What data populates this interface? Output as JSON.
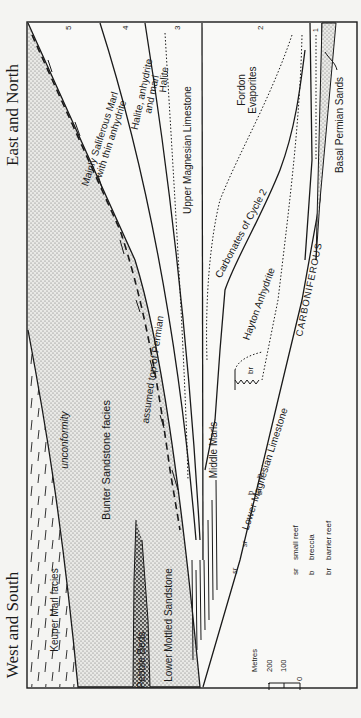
{
  "figure": {
    "orientation": "rotated 90deg counter-clockwise",
    "directions": {
      "top": "East and North",
      "bottom": "West and South"
    },
    "cycle_numbers": [
      "5",
      "4",
      "3",
      "2",
      "1"
    ],
    "units": {
      "keuper": "Keuper Marl facies",
      "unconformity": "unconformity",
      "bunter": "Bunter Sandstone facies",
      "top_permian": "assumed top of Permian",
      "pebble_beds": "Pebble Beds",
      "lower_mottled": "Lower Mottled Sandstone",
      "saliferous_1": "Mainly Saliferous Marl",
      "saliferous_2": "with thin anhydrite",
      "halite_anhydrite_1": "Halite, anhydrite",
      "halite_anhydrite_2": "and marl",
      "halite": "Halite",
      "upper_magnesian": "Upper Magnesian Limestone",
      "middle_marls": "Middle Marls",
      "fordon_1": "Fordon",
      "fordon_2": "Evaporites",
      "carbonates_cycle2": "Carbonates of Cycle 2",
      "hayton": "Hayton Anhydrite",
      "lower_magnesian": "Lower Magnesian Limestone",
      "carboniferous": "CARBONIFEROUS",
      "basal_permian": "Basal Permian Sands"
    },
    "symbols_on_section": {
      "br": "br",
      "b": "b",
      "sr": "sr"
    },
    "legend": [
      {
        "abbr": "sr",
        "meaning": "small reef"
      },
      {
        "abbr": "b",
        "meaning": "breccia"
      },
      {
        "abbr": "br",
        "meaning": "barrier reef"
      }
    ],
    "scale": {
      "title": "Metres",
      "ticks": [
        "200",
        "100",
        "0"
      ]
    }
  }
}
